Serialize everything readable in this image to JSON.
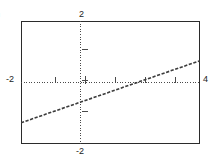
{
  "figure": {
    "label": ")",
    "background_color": "#ffffff",
    "frame_color": "#2b2b2b",
    "axis_color": "#4a4a4a",
    "curve_color": "#3c3c3c"
  },
  "labels": {
    "y_top": "2",
    "y_bottom": "-2",
    "x_left": "-2",
    "x_right": "4"
  },
  "chart_data": {
    "type": "line",
    "title": "",
    "xlabel": "",
    "ylabel": "",
    "xlim": [
      -2,
      4
    ],
    "ylim": [
      -2,
      2
    ],
    "xticks": [
      -2,
      4
    ],
    "yticks": [
      -2,
      2
    ],
    "xtick_labels": [
      "-2",
      "4"
    ],
    "ytick_labels": [
      "-2",
      "2"
    ],
    "grid": false,
    "axes_style": "dotted-crosshair-through-origin",
    "line_style": "dashed",
    "series": [
      {
        "name": "line",
        "x": [
          -2,
          -1,
          0,
          1,
          2,
          3,
          4
        ],
        "y": [
          -1.31,
          -0.97,
          -0.64,
          -0.3,
          0.04,
          0.38,
          0.71
        ],
        "slope": 0.337,
        "intercept": -0.637,
        "x_intercept": 1.89,
        "y_intercept": -0.64
      }
    ],
    "annotations": []
  }
}
